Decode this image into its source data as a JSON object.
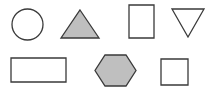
{
  "canvas": {
    "width": 214,
    "height": 88,
    "background": "#ffffff",
    "title": "Geometric shapes grid"
  },
  "style": {
    "outline_color": "#3a3a3a",
    "fill_gray": "#bfbfbf",
    "fill_none": "none",
    "stroke_width": 1.3
  },
  "shapes": [
    {
      "id": "circle",
      "name": "Circle",
      "row": 1,
      "column": 1,
      "filled": false,
      "fill": "none",
      "stroke": "#3a3a3a",
      "cx": 27.5,
      "cy": 24.5,
      "r": 15.5
    },
    {
      "id": "triangle-up",
      "name": "Triangle",
      "row": 1,
      "column": 2,
      "filled": true,
      "fill": "#bfbfbf",
      "stroke": "#3a3a3a",
      "points": "80,10 99,38 61,38"
    },
    {
      "id": "rectangle-portrait",
      "name": "Rectangle (portrait)",
      "row": 1,
      "column": 3,
      "filled": false,
      "fill": "none",
      "stroke": "#3a3a3a",
      "x": 129,
      "y": 5,
      "width": 25,
      "height": 33
    },
    {
      "id": "triangle-down",
      "name": "Inverted triangle",
      "row": 1,
      "column": 4,
      "filled": false,
      "fill": "none",
      "stroke": "#3a3a3a",
      "points": "172,9 204,9 188,37"
    },
    {
      "id": "rectangle-landscape",
      "name": "Rectangle (landscape)",
      "row": 2,
      "column": 1,
      "filled": false,
      "fill": "none",
      "stroke": "#3a3a3a",
      "x": 11,
      "y": 58,
      "width": 55,
      "height": 24
    },
    {
      "id": "hexagon",
      "name": "Hexagon",
      "row": 2,
      "column": 2,
      "filled": true,
      "fill": "#bfbfbf",
      "stroke": "#3a3a3a",
      "points": "105,55 126,55 136,70.5 126,86 105,86 95,70.5"
    },
    {
      "id": "square",
      "name": "Square",
      "row": 2,
      "column": 3,
      "filled": false,
      "fill": "none",
      "stroke": "#3a3a3a",
      "x": 161,
      "y": 59,
      "width": 27,
      "height": 26
    }
  ]
}
